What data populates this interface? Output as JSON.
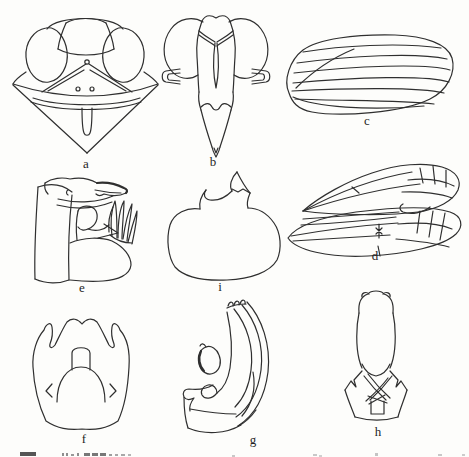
{
  "figure": {
    "panels": [
      {
        "label": "a"
      },
      {
        "label": "b"
      },
      {
        "label": "c"
      },
      {
        "label": "d"
      },
      {
        "label": "e"
      },
      {
        "label": "i"
      },
      {
        "label": "f"
      },
      {
        "label": "g"
      },
      {
        "label": "h"
      }
    ],
    "colors": {
      "line": "#2f2f2f",
      "background": "#fdfdfb",
      "label_text": "#1f1f1f"
    }
  }
}
